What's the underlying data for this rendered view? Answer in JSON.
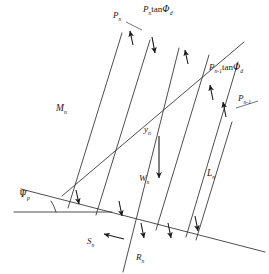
{
  "figure": {
    "type": "force-diagram",
    "width": 269,
    "height": 274,
    "background_color": "#ffffff",
    "line_color": "#3a3a3a",
    "text_color": "#1a1a1a"
  },
  "labels": {
    "p_n": {
      "base": "P",
      "sub": "n"
    },
    "p_n_tan_phi_d": {
      "base": "P",
      "sub": "n",
      "operator": "tan",
      "greek": "Φ",
      "greek_sub": "d"
    },
    "p_n_minus_1_tan_phi_d": {
      "base": "P",
      "sub": "n-1",
      "operator": "tan",
      "greek": "Φ",
      "greek_sub": "d"
    },
    "p_n_minus_1": {
      "base": "P",
      "sub": "n-1"
    },
    "m_n": {
      "base": "M",
      "sub": "n"
    },
    "y_n": {
      "base": "y",
      "sub": "n"
    },
    "w_n": {
      "base": "W",
      "sub": "n"
    },
    "l_n": {
      "base": "L",
      "sub": "n"
    },
    "s_n": {
      "base": "S",
      "sub": "n"
    },
    "r_n": {
      "base": "R",
      "sub": "n"
    },
    "psi_p": {
      "greek": "Ψ",
      "sub": "p"
    }
  },
  "geometry": {
    "slip_surface": {
      "x1": 20,
      "y1": 212,
      "x2": 262,
      "y2": 258,
      "note": "inclined failure plane"
    },
    "horizontal_datum": {
      "x1": 20,
      "y1": 212,
      "x2": 112,
      "y2": 212
    },
    "upper_surface": {
      "x1": 62,
      "y1": 194,
      "x2": 246,
      "y2": 43
    },
    "angle_arc_label": "Ψp between horizontal datum and slip surface"
  }
}
